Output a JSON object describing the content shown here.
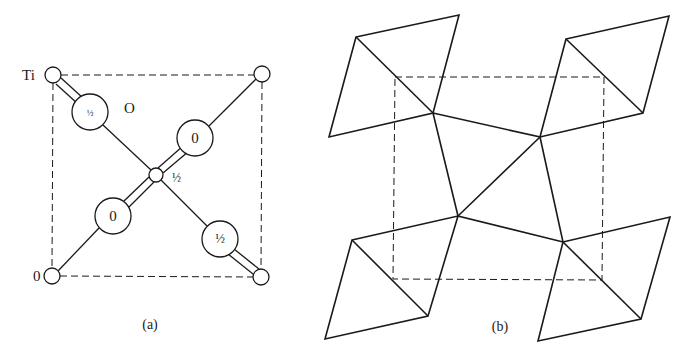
{
  "figure": {
    "ink_color": "#1a1a1a",
    "background": "#ffffff"
  },
  "panel_a": {
    "caption": "(a)",
    "cell_corners": {
      "tl": [
        53,
        75
      ],
      "tr": [
        262,
        75
      ],
      "bl": [
        53,
        276
      ],
      "br": [
        261,
        277
      ]
    },
    "labels": {
      "ti": "Ti",
      "o": "O",
      "origin": "0",
      "center_height": "½"
    },
    "titanium_atoms": [
      {
        "name": "ti-corner-top-left",
        "x": 53,
        "y": 75,
        "r": 8
      },
      {
        "name": "ti-corner-top-right",
        "x": 262,
        "y": 74,
        "r": 8
      },
      {
        "name": "ti-corner-bottom-left",
        "x": 52,
        "y": 276,
        "r": 8
      },
      {
        "name": "ti-corner-bottom-right",
        "x": 261,
        "y": 277,
        "r": 8
      },
      {
        "name": "ti-center",
        "x": 156,
        "y": 175,
        "r": 7
      }
    ],
    "oxygen_atoms": [
      {
        "name": "oxygen-upper-left",
        "x": 90,
        "y": 112,
        "r": 18,
        "height": "½"
      },
      {
        "name": "oxygen-upper-right",
        "x": 195,
        "y": 138,
        "r": 18,
        "height": "0"
      },
      {
        "name": "oxygen-lower-left",
        "x": 113,
        "y": 216,
        "r": 18,
        "height": "0"
      },
      {
        "name": "oxygen-lower-right",
        "x": 220,
        "y": 239,
        "r": 18,
        "height": "½"
      }
    ]
  },
  "panel_b": {
    "caption": "(b)",
    "cell_corners": {
      "tl": [
        395,
        77
      ],
      "tr": [
        604,
        77
      ],
      "bl": [
        393,
        279
      ],
      "br": [
        602,
        280
      ]
    },
    "center_vertices": {
      "A": [
        433,
        113
      ],
      "B": [
        540,
        137
      ],
      "C": [
        458,
        216
      ],
      "D": [
        563,
        242
      ]
    },
    "octahedra": [
      {
        "name": "octahedron-top-left",
        "points": [
          [
            356,
            37
          ],
          [
            459,
            15
          ],
          [
            433,
            113
          ],
          [
            329,
            137
          ]
        ],
        "diagonal": [
          [
            356,
            37
          ],
          [
            433,
            113
          ]
        ]
      },
      {
        "name": "octahedron-top-right",
        "points": [
          [
            566,
            39
          ],
          [
            669,
            16
          ],
          [
            643,
            113
          ],
          [
            540,
            137
          ]
        ],
        "diagonal": [
          [
            566,
            39
          ],
          [
            643,
            113
          ]
        ]
      },
      {
        "name": "octahedron-bottom-left",
        "points": [
          [
            352,
            240
          ],
          [
            458,
            216
          ],
          [
            428,
            316
          ],
          [
            325,
            339
          ]
        ],
        "diagonal": [
          [
            352,
            240
          ],
          [
            428,
            316
          ]
        ]
      },
      {
        "name": "octahedron-bottom-right",
        "points": [
          [
            563,
            242
          ],
          [
            670,
            217
          ],
          [
            641,
            319
          ],
          [
            538,
            341
          ]
        ],
        "diagonal": [
          [
            563,
            242
          ],
          [
            641,
            319
          ]
        ]
      }
    ]
  }
}
